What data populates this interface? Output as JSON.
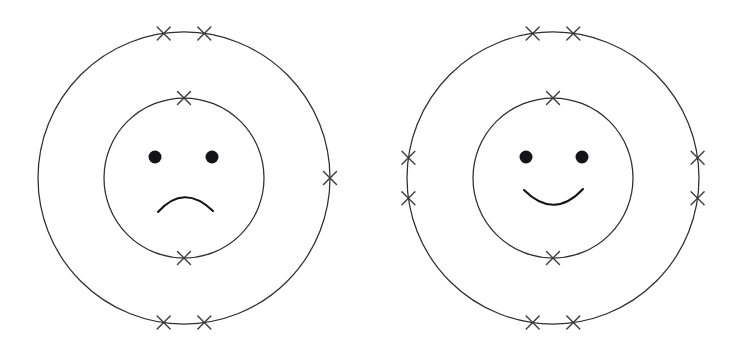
{
  "canvas": {
    "width": 738,
    "height": 356,
    "background_color": "#ffffff"
  },
  "style": {
    "ring_stroke_color": "#2e2e33",
    "ring_stroke_width": 1.25,
    "electron_stroke_color": "#3a3a40",
    "electron_stroke_width": 1.35,
    "electron_arm_length": 6.5,
    "face_ink_color": "#141418",
    "mouth_stroke_width": 2.1,
    "eye_radius": 6.5
  },
  "diagram": {
    "type": "bohr-model-pair",
    "atom_count": 2,
    "electron_symbol": "x"
  },
  "atoms": [
    {
      "id": "atom-left",
      "label": "left-atom",
      "mood": "sad",
      "center": {
        "x": 184,
        "y": 178
      },
      "shells": [
        {
          "name": "inner-shell",
          "index": 1,
          "radius": 80,
          "electron_count": 2,
          "electron_angles_deg": [
            270,
            90
          ]
        },
        {
          "name": "outer-shell",
          "index": 2,
          "radius": 146,
          "electron_count": 5,
          "electron_angles_deg": [
            262,
            278,
            0,
            82,
            98
          ]
        }
      ],
      "total_electrons": 7,
      "face": {
        "expression": "frown",
        "eyes": [
          {
            "cx": 155,
            "cy": 157,
            "r": 6.5
          },
          {
            "cx": 212,
            "cy": 157,
            "r": 6.5
          }
        ],
        "mouth_path": "M 158 212 Q 184 183 213 211"
      }
    },
    {
      "id": "atom-right",
      "label": "right-atom",
      "mood": "happy",
      "center": {
        "x": 553,
        "y": 178
      },
      "shells": [
        {
          "name": "inner-shell",
          "index": 1,
          "radius": 80,
          "electron_count": 2,
          "electron_angles_deg": [
            270,
            90
          ]
        },
        {
          "name": "outer-shell",
          "index": 2,
          "radius": 146,
          "electron_count": 8,
          "electron_angles_deg": [
            262,
            278,
            352,
            8,
            82,
            98,
            172,
            188
          ]
        }
      ],
      "total_electrons": 10,
      "face": {
        "expression": "smile",
        "eyes": [
          {
            "cx": 526,
            "cy": 157,
            "r": 6.5
          },
          {
            "cx": 582,
            "cy": 157,
            "r": 6.5
          }
        ],
        "mouth_path": "M 524 190 Q 554 220 583 189"
      }
    }
  ]
}
